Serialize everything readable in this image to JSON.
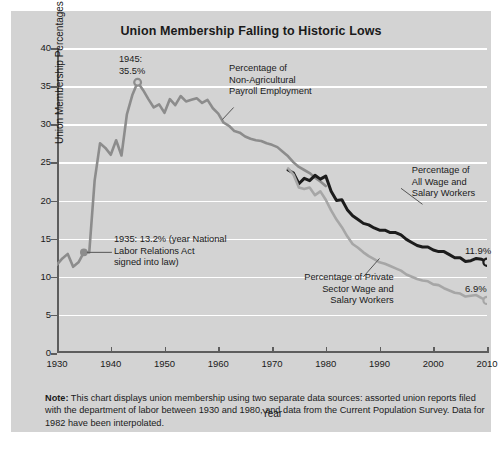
{
  "chart_data": {
    "type": "line",
    "title": "Union Membership Falling to Historic Lows",
    "xlabel": "Year",
    "ylabel": "Union Membership Percentages",
    "xlim": [
      1930,
      2010
    ],
    "ylim": [
      0,
      40
    ],
    "xticks": [
      1930,
      1940,
      1950,
      1960,
      1970,
      1980,
      1990,
      2000,
      2010
    ],
    "yticks": [
      0,
      5,
      10,
      15,
      20,
      25,
      30,
      35,
      40
    ],
    "grid": true,
    "legend_position": "inline-annotations",
    "series": [
      {
        "name": "Percentage of Non-Agricultural Payroll Employment",
        "color": "#8c8c8c",
        "x": [
          1930,
          1931,
          1932,
          1933,
          1934,
          1935,
          1936,
          1937,
          1938,
          1939,
          1940,
          1941,
          1942,
          1943,
          1944,
          1945,
          1946,
          1947,
          1948,
          1949,
          1950,
          1951,
          1952,
          1953,
          1954,
          1955,
          1956,
          1957,
          1958,
          1959,
          1960,
          1961,
          1962,
          1963,
          1964,
          1965,
          1966,
          1967,
          1968,
          1969,
          1970,
          1971,
          1972,
          1973,
          1974,
          1975,
          1976,
          1977,
          1978,
          1979,
          1980
        ],
        "values": [
          11.6,
          12.4,
          13.0,
          11.3,
          11.9,
          13.2,
          13.2,
          22.6,
          27.5,
          26.9,
          26.0,
          27.9,
          25.9,
          31.3,
          33.8,
          35.5,
          34.5,
          33.3,
          32.2,
          32.6,
          31.5,
          33.3,
          32.5,
          33.7,
          33.0,
          33.2,
          33.4,
          32.8,
          33.2,
          32.1,
          31.4,
          30.2,
          29.8,
          29.1,
          28.9,
          28.4,
          28.1,
          27.9,
          27.8,
          27.5,
          27.3,
          27.0,
          26.4,
          25.8,
          25.0,
          24.4,
          24.0,
          23.6,
          23.0,
          22.5,
          21.9
        ]
      },
      {
        "name": "Percentage of All Wage and Salary Workers",
        "color": "#1c1c1c",
        "x": [
          1973,
          1974,
          1975,
          1976,
          1977,
          1978,
          1979,
          1980,
          1981,
          1982,
          1983,
          1984,
          1985,
          1986,
          1987,
          1988,
          1989,
          1990,
          1991,
          1992,
          1993,
          1994,
          1995,
          1996,
          1997,
          1998,
          1999,
          2000,
          2001,
          2002,
          2003,
          2004,
          2005,
          2006,
          2007,
          2008,
          2009,
          2010
        ],
        "values": [
          24.0,
          23.6,
          22.2,
          22.9,
          22.6,
          23.3,
          22.8,
          23.2,
          21.2,
          20.0,
          20.1,
          18.8,
          18.0,
          17.5,
          17.0,
          16.8,
          16.4,
          16.1,
          16.1,
          15.8,
          15.8,
          15.5,
          14.9,
          14.5,
          14.1,
          13.9,
          13.9,
          13.5,
          13.3,
          13.3,
          12.9,
          12.5,
          12.5,
          12.0,
          12.1,
          12.4,
          12.3,
          11.9
        ]
      },
      {
        "name": "Percentage of Private Sector Wage and Salary Workers",
        "color": "#a6a6a6",
        "x": [
          1973,
          1974,
          1975,
          1976,
          1977,
          1978,
          1979,
          1980,
          1981,
          1982,
          1983,
          1984,
          1985,
          1986,
          1987,
          1988,
          1989,
          1990,
          1991,
          1992,
          1993,
          1994,
          1995,
          1996,
          1997,
          1998,
          1999,
          2000,
          2001,
          2002,
          2003,
          2004,
          2005,
          2006,
          2007,
          2008,
          2009,
          2010
        ],
        "values": [
          24.2,
          23.4,
          21.7,
          21.5,
          21.7,
          20.7,
          21.2,
          20.1,
          18.7,
          17.5,
          16.5,
          15.3,
          14.3,
          13.8,
          13.2,
          12.7,
          12.3,
          11.9,
          11.7,
          11.4,
          11.1,
          10.8,
          10.3,
          10.0,
          9.7,
          9.5,
          9.4,
          9.0,
          8.9,
          8.5,
          8.2,
          7.9,
          7.8,
          7.4,
          7.5,
          7.6,
          7.2,
          6.9
        ]
      }
    ],
    "annotations": [
      {
        "id": "peak-1945",
        "text": "1945:\n35.5%",
        "x": 1945,
        "y": 35.5
      },
      {
        "id": "nlra-1935",
        "text": "1935: 13.2% (year National\nLabor Relations Act\nsigned into law)",
        "x": 1935,
        "y": 13.2
      },
      {
        "id": "series-label-nonag",
        "text": "Percentage of\nNon-Agricultural\nPayroll Employment"
      },
      {
        "id": "series-label-allwage",
        "text": "Percentage of\nAll Wage and\nSalary Workers"
      },
      {
        "id": "series-label-private",
        "text": "Percentage of Private\nSector Wage and\nSalary Workers"
      }
    ],
    "endpoint_labels": [
      {
        "id": "endpoint-allwage",
        "text": "11.9%",
        "x": 2010,
        "y": 11.9
      },
      {
        "id": "endpoint-private",
        "text": "6.9%",
        "x": 2010,
        "y": 6.9
      }
    ]
  },
  "note": {
    "prefix": "Note:",
    "body": " This chart displays union membership using two separate data sources: assorted union reports filed with the department of labor between 1930 and 1980, and data from the Current Population Survey. Data for 1982 have been interpolated."
  },
  "colors": {
    "card_background": "#d3d3d3",
    "gridline": "#ffffff",
    "axis": "#5d5d5d",
    "series_gray": "#8c8c8c",
    "series_dark": "#1c1c1c",
    "series_light_gray": "#a6a6a6",
    "text": "#1a1a1a"
  }
}
